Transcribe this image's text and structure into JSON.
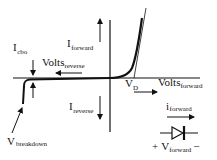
{
  "diagram": {
    "colors": {
      "ink": "#111111",
      "background": "#ffffff"
    },
    "labels": {
      "i_cbo": {
        "main": "I",
        "sub": "cbo"
      },
      "volts_reverse": {
        "main": "Volts",
        "sub": "reverse"
      },
      "i_forward": {
        "main": "I",
        "sub": "forward"
      },
      "i_reverse": {
        "main": "I",
        "sub": "reverse"
      },
      "v_d": {
        "main": "V",
        "sub": "D"
      },
      "volts_forward": {
        "main": "Volts",
        "sub": "forward"
      },
      "i_forward_small": {
        "main": "i",
        "sub": "forward"
      },
      "v_breakdown": {
        "main": "V",
        "sub": "breakdown"
      },
      "v_forward": {
        "plus": "+",
        "main": "V",
        "sub": "forward",
        "minus": "−"
      }
    },
    "symbol": {
      "name": "diode-symbol",
      "orientation": "anode-left"
    }
  }
}
